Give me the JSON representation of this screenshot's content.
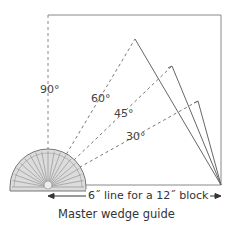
{
  "diagram": {
    "caption": "Master wedge guide",
    "dimension_label": "6˝ line for a 12˝ block",
    "angles": [
      {
        "label": "90°",
        "degrees": 90
      },
      {
        "label": "60°",
        "degrees": 60
      },
      {
        "label": "45°",
        "degrees": 45
      },
      {
        "label": "30°",
        "degrees": 30
      }
    ],
    "colors": {
      "line": "#666666",
      "dashed": "#777777",
      "protractor_fill": "#d9d9d9",
      "text": "#333333"
    }
  }
}
